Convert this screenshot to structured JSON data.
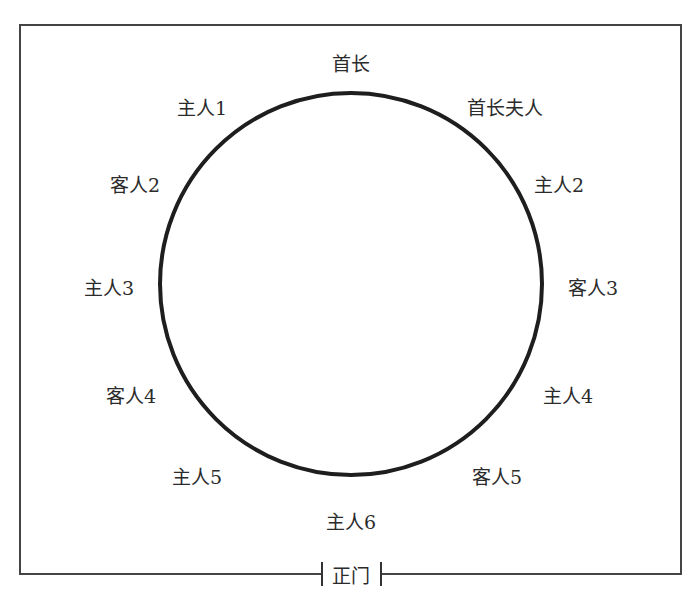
{
  "diagram": {
    "type": "round-table-seating",
    "room": {
      "left": 19,
      "top": 24,
      "right": 681,
      "bottom": 574
    },
    "table": {
      "cx": 351,
      "cy": 284,
      "r": 193
    },
    "door": {
      "label": "正门",
      "gap_left": 322,
      "gap_right": 381
    },
    "seats": [
      {
        "id": "chief",
        "label": "首长",
        "x": 351,
        "y": 64
      },
      {
        "id": "chief-spouse",
        "label": "首长夫人",
        "x": 505,
        "y": 108
      },
      {
        "id": "host-1",
        "label": "主人1",
        "x": 202,
        "y": 108
      },
      {
        "id": "host-2",
        "label": "主人2",
        "x": 559,
        "y": 185
      },
      {
        "id": "guest-2",
        "label": "客人2",
        "x": 135,
        "y": 185
      },
      {
        "id": "guest-3",
        "label": "客人3",
        "x": 593,
        "y": 288
      },
      {
        "id": "host-3",
        "label": "主人3",
        "x": 109,
        "y": 288
      },
      {
        "id": "host-4",
        "label": "主人4",
        "x": 568,
        "y": 396
      },
      {
        "id": "guest-4",
        "label": "客人4",
        "x": 131,
        "y": 396
      },
      {
        "id": "guest-5",
        "label": "客人5",
        "x": 497,
        "y": 477
      },
      {
        "id": "host-5",
        "label": "主人5",
        "x": 197,
        "y": 477
      },
      {
        "id": "host-6",
        "label": "主人6",
        "x": 351,
        "y": 522
      }
    ]
  }
}
